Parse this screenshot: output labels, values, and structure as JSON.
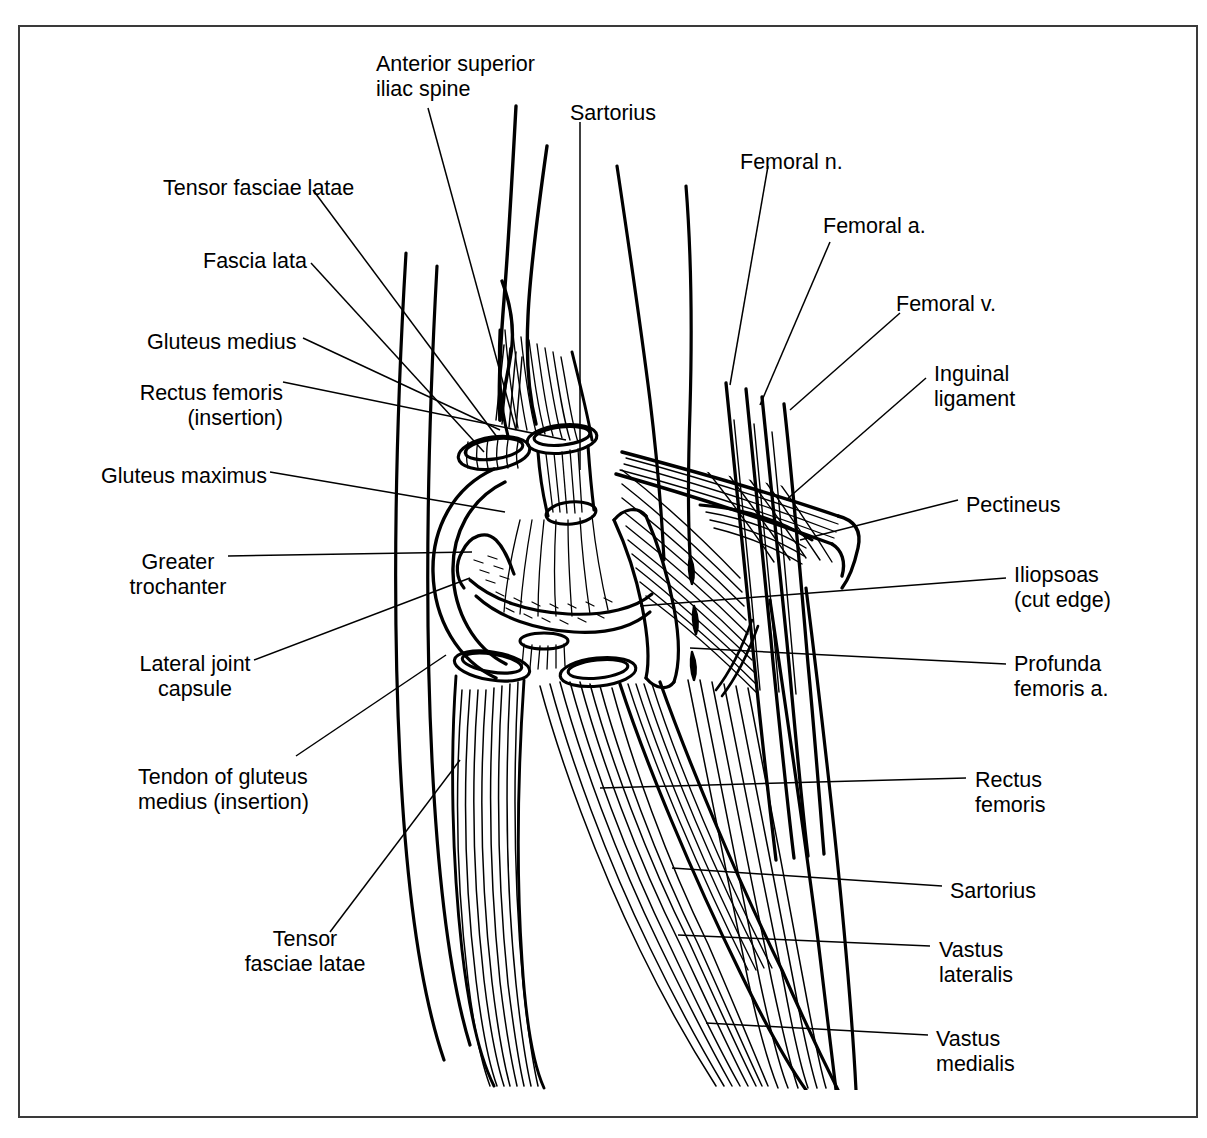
{
  "figure": {
    "type": "anatomical-line-drawing",
    "view": "Anterolateral view of right hip and proximal thigh",
    "style": "black-and-white pen-and-ink line art with muscle-fiber hatching",
    "border_color": "#3a3a3a",
    "ink_color": "#000000",
    "background_color": "#ffffff"
  },
  "labels": {
    "left": [
      {
        "id": "tensor-fasciae-latae-upper",
        "text": "Tensor fasciae latae",
        "x": 163,
        "y": 176,
        "align": "left"
      },
      {
        "id": "fascia-lata",
        "text": "Fascia lata",
        "x": 203,
        "y": 249,
        "align": "left"
      },
      {
        "id": "gluteus-medius",
        "text": "Gluteus medius",
        "x": 147,
        "y": 330,
        "align": "left"
      },
      {
        "id": "rectus-femoris-insertion",
        "text": "Rectus femoris\n(insertion)",
        "x": 129,
        "y": 381,
        "align": "left"
      },
      {
        "id": "gluteus-maximus",
        "text": "Gluteus maximus",
        "x": 101,
        "y": 464,
        "align": "left"
      },
      {
        "id": "greater-trochanter",
        "text": "Greater\ntrochanter",
        "x": 152,
        "y": 550,
        "align": "left"
      },
      {
        "id": "lateral-joint-capsule",
        "text": "Lateral joint\ncapsule",
        "x": 136,
        "y": 652,
        "align": "left"
      },
      {
        "id": "tendon-of-gluteus-medius-insertion",
        "text": "Tendon of gluteus\nmedius (insertion)",
        "x": 138,
        "y": 765,
        "align": "left"
      },
      {
        "id": "tensor-fasciae-latae-lower",
        "text": "Tensor\nfasciae latae",
        "x": 255,
        "y": 927,
        "align": "left"
      }
    ],
    "top": [
      {
        "id": "anterior-superior-iliac-spine",
        "text": "Anterior superior\niliac spine",
        "x": 376,
        "y": 52,
        "align": "left"
      },
      {
        "id": "sartorius-top",
        "text": "Sartorius",
        "x": 570,
        "y": 101,
        "align": "left"
      }
    ],
    "right": [
      {
        "id": "femoral-n",
        "text": "Femoral n.",
        "x": 740,
        "y": 150,
        "align": "left"
      },
      {
        "id": "femoral-a",
        "text": "Femoral a.",
        "x": 823,
        "y": 214,
        "align": "left"
      },
      {
        "id": "femoral-v",
        "text": "Femoral v.",
        "x": 896,
        "y": 292,
        "align": "left"
      },
      {
        "id": "inguinal-ligament",
        "text": "Inguinal\nligament",
        "x": 934,
        "y": 362,
        "align": "left"
      },
      {
        "id": "pectineus",
        "text": "Pectineus",
        "x": 966,
        "y": 493,
        "align": "left"
      },
      {
        "id": "iliopsoas-cut-edge",
        "text": "Iliopsoas\n(cut edge)",
        "x": 1014,
        "y": 563,
        "align": "left"
      },
      {
        "id": "profunda-femoris-a",
        "text": "Profunda\nfemoris a.",
        "x": 1014,
        "y": 652,
        "align": "left"
      },
      {
        "id": "rectus-femoris",
        "text": "Rectus\nfemoris",
        "x": 975,
        "y": 768,
        "align": "left"
      },
      {
        "id": "sartorius-right",
        "text": "Sartorius",
        "x": 950,
        "y": 879,
        "align": "left"
      },
      {
        "id": "vastus-lateralis",
        "text": "Vastus\nlateralis",
        "x": 939,
        "y": 938,
        "align": "left"
      },
      {
        "id": "vastus-medialis",
        "text": "Vastus\nmedialis",
        "x": 936,
        "y": 1027,
        "align": "left"
      }
    ]
  },
  "leader_lines": [
    {
      "id": "leader-anterior-superior-iliac-spine",
      "from": [
        428,
        108
      ],
      "to": [
        516,
        430
      ]
    },
    {
      "id": "leader-sartorius-top",
      "from": [
        580,
        122
      ],
      "to": [
        580,
        470
      ]
    },
    {
      "id": "leader-tensor-fasciae-latae-upper",
      "from": [
        313,
        190
      ],
      "to": [
        497,
        437
      ]
    },
    {
      "id": "leader-fascia-lata",
      "from": [
        311,
        263
      ],
      "to": [
        484,
        452
      ]
    },
    {
      "id": "leader-gluteus-medius",
      "from": [
        303,
        338
      ],
      "to": [
        500,
        430
      ]
    },
    {
      "id": "leader-rectus-femoris-insertion",
      "from": [
        283,
        382
      ],
      "to": [
        566,
        440
      ]
    },
    {
      "id": "leader-gluteus-maximus",
      "from": [
        270,
        472
      ],
      "to": [
        505,
        512
      ]
    },
    {
      "id": "leader-greater-trochanter",
      "from": [
        228,
        556
      ],
      "to": [
        472,
        552
      ]
    },
    {
      "id": "leader-lateral-joint-capsule",
      "from": [
        254,
        660
      ],
      "to": [
        470,
        578
      ]
    },
    {
      "id": "leader-tendon-of-gluteus-medius",
      "from": [
        296,
        756
      ],
      "to": [
        446,
        655
      ]
    },
    {
      "id": "leader-tensor-fasciae-latae-lower",
      "from": [
        330,
        932
      ],
      "to": [
        460,
        760
      ]
    },
    {
      "id": "leader-femoral-n",
      "from": [
        768,
        166
      ],
      "to": [
        730,
        385
      ]
    },
    {
      "id": "leader-femoral-a",
      "from": [
        830,
        242
      ],
      "to": [
        760,
        405
      ]
    },
    {
      "id": "leader-femoral-v",
      "from": [
        900,
        313
      ],
      "to": [
        790,
        410
      ]
    },
    {
      "id": "leader-inguinal-ligament",
      "from": [
        926,
        378
      ],
      "to": [
        786,
        500
      ]
    },
    {
      "id": "leader-pectineus",
      "from": [
        958,
        500
      ],
      "to": [
        800,
        540
      ]
    },
    {
      "id": "leader-iliopsoas-cut-edge",
      "from": [
        1006,
        578
      ],
      "to": [
        640,
        606
      ]
    },
    {
      "id": "leader-profunda-femoris-a",
      "from": [
        1006,
        664
      ],
      "to": [
        690,
        648
      ]
    },
    {
      "id": "leader-rectus-femoris",
      "from": [
        966,
        778
      ],
      "to": [
        600,
        788
      ]
    },
    {
      "id": "leader-sartorius-right",
      "from": [
        942,
        886
      ],
      "to": [
        672,
        868
      ]
    },
    {
      "id": "leader-vastus-lateralis",
      "from": [
        930,
        946
      ],
      "to": [
        678,
        935
      ]
    },
    {
      "id": "leader-vastus-medialis",
      "from": [
        928,
        1035
      ],
      "to": [
        706,
        1023
      ]
    }
  ],
  "structures": [
    {
      "id": "iliac-crest-outline",
      "name": "Anterior superior iliac spine and iliac blade"
    },
    {
      "id": "fascia-lata-band",
      "name": "Fascia lata / iliotibial tract lateral outline"
    },
    {
      "id": "gluteus-maximus-ring",
      "name": "Gluteus maximus cut ring over greater trochanter"
    },
    {
      "id": "greater-trochanter-bone",
      "name": "Greater trochanter of femur"
    },
    {
      "id": "cut-muscle-ovals",
      "name": "Cut ends of gluteus medius and tensor fasciae latae"
    },
    {
      "id": "inguinal-ligament-band",
      "name": "Inguinal ligament"
    },
    {
      "id": "femoral-vessel-bundle",
      "name": "Femoral nerve, artery and vein bundle"
    },
    {
      "id": "iliopsoas-cut",
      "name": "Iliopsoas cut edge"
    },
    {
      "id": "pectineus-muscle",
      "name": "Pectineus"
    },
    {
      "id": "quadriceps-mass",
      "name": "Rectus femoris, vastus lateralis, vastus medialis"
    },
    {
      "id": "sartorius-strap",
      "name": "Sartorius strap muscle crossing the thigh"
    }
  ]
}
